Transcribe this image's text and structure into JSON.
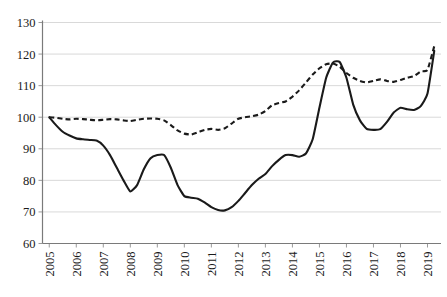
{
  "chart_data": {
    "type": "line",
    "title": "",
    "subtitle": "",
    "xlabel": "",
    "ylabel": "",
    "xlim": [
      2004.75,
      2019.5
    ],
    "ylim": [
      60,
      130
    ],
    "ytick_values": [
      60,
      70,
      80,
      90,
      100,
      110,
      120,
      130
    ],
    "ytick_labels": [
      "60",
      "70",
      "80",
      "90",
      "100",
      "110",
      "120",
      "130"
    ],
    "xtick_values": [
      2005,
      2006,
      2007,
      2008,
      2009,
      2010,
      2011,
      2012,
      2013,
      2014,
      2015,
      2016,
      2017,
      2018,
      2019
    ],
    "xtick_labels": [
      "2005",
      "2006",
      "2007",
      "2008",
      "2009",
      "2010",
      "2011",
      "2012",
      "2013",
      "2014",
      "2015",
      "2016",
      "2017",
      "2018",
      "2019"
    ],
    "grid": true,
    "grid_axis": "y",
    "legend": false,
    "legend_position": "none",
    "line_color": "#1a1a1a",
    "grid_color": "#d9d9d9",
    "axis_color": "#7a7a7a",
    "series": [
      {
        "name": "solid-series",
        "style": "solid",
        "x": [
          2005.0,
          2005.25,
          2005.5,
          2005.75,
          2006.0,
          2006.25,
          2006.5,
          2006.75,
          2007.0,
          2007.25,
          2007.5,
          2007.75,
          2008.0,
          2008.25,
          2008.5,
          2008.75,
          2009.0,
          2009.25,
          2009.5,
          2009.75,
          2010.0,
          2010.25,
          2010.5,
          2010.75,
          2011.0,
          2011.25,
          2011.5,
          2011.75,
          2012.0,
          2012.25,
          2012.5,
          2012.75,
          2013.0,
          2013.25,
          2013.5,
          2013.75,
          2014.0,
          2014.25,
          2014.5,
          2014.75,
          2015.0,
          2015.25,
          2015.5,
          2015.75,
          2016.0,
          2016.25,
          2016.5,
          2016.75,
          2017.0,
          2017.25,
          2017.5,
          2017.75,
          2018.0,
          2018.25,
          2018.5,
          2018.75,
          2019.0,
          2019.25
        ],
        "y": [
          100.0,
          97.5,
          95.4,
          94.2,
          93.3,
          93.0,
          92.8,
          92.6,
          91.0,
          88.0,
          84.0,
          80.0,
          76.5,
          78.5,
          83.5,
          87.0,
          88.0,
          88.0,
          84.0,
          78.5,
          75.0,
          74.5,
          74.2,
          73.0,
          71.5,
          70.6,
          70.5,
          71.5,
          73.5,
          76.0,
          78.5,
          80.5,
          82.0,
          84.5,
          86.5,
          88.0,
          88.0,
          87.5,
          88.5,
          93.0,
          103.0,
          112.5,
          117.3,
          117.5,
          112.5,
          104.0,
          99.0,
          96.3,
          96.0,
          96.2,
          98.5,
          101.5,
          103.0,
          102.5,
          102.3,
          103.5,
          107.5,
          121.0
        ]
      },
      {
        "name": "dashed-series",
        "style": "dashed",
        "x": [
          2005.0,
          2005.25,
          2005.5,
          2005.75,
          2006.0,
          2006.25,
          2006.5,
          2006.75,
          2007.0,
          2007.25,
          2007.5,
          2007.75,
          2008.0,
          2008.25,
          2008.5,
          2008.75,
          2009.0,
          2009.25,
          2009.5,
          2009.75,
          2010.0,
          2010.25,
          2010.5,
          2010.75,
          2011.0,
          2011.25,
          2011.5,
          2011.75,
          2012.0,
          2012.25,
          2012.5,
          2012.75,
          2013.0,
          2013.25,
          2013.5,
          2013.75,
          2014.0,
          2014.25,
          2014.5,
          2014.75,
          2015.0,
          2015.25,
          2015.5,
          2015.75,
          2016.0,
          2016.25,
          2016.5,
          2016.75,
          2017.0,
          2017.25,
          2017.5,
          2017.75,
          2018.0,
          2018.25,
          2018.5,
          2018.75,
          2019.0,
          2019.25
        ],
        "y": [
          100.0,
          99.8,
          99.5,
          99.3,
          99.5,
          99.4,
          99.2,
          99.0,
          99.2,
          99.4,
          99.3,
          99.0,
          98.8,
          99.2,
          99.5,
          99.6,
          99.5,
          99.0,
          97.5,
          95.8,
          94.8,
          94.5,
          95.2,
          96.0,
          96.3,
          96.0,
          96.5,
          98.0,
          99.5,
          100.0,
          100.3,
          100.8,
          102.0,
          103.8,
          104.5,
          105.0,
          106.5,
          108.5,
          111.0,
          113.5,
          115.5,
          116.8,
          117.0,
          116.0,
          114.0,
          112.5,
          111.5,
          111.0,
          111.5,
          112.0,
          111.5,
          111.2,
          111.8,
          112.5,
          113.0,
          114.5,
          115.0,
          122.5
        ]
      }
    ]
  }
}
